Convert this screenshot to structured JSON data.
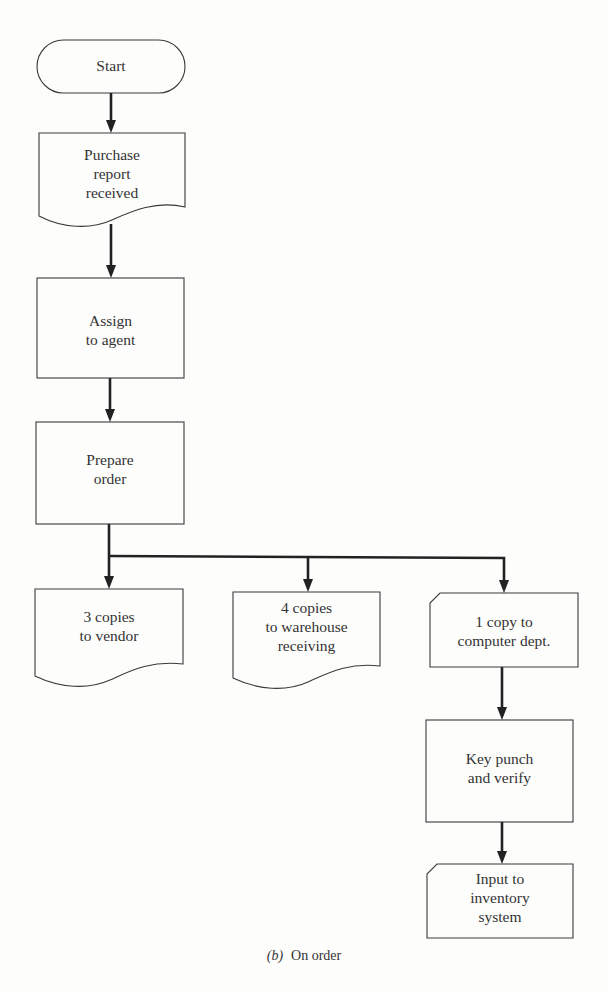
{
  "diagram": {
    "type": "flowchart",
    "caption": {
      "letter": "(b)",
      "text": "On order"
    },
    "colors": {
      "stroke": "#3a3a3a",
      "arrow": "#222222",
      "background": "#fdfdfc"
    },
    "nodes": [
      {
        "id": "start",
        "shape": "terminal",
        "lines": [
          "Start"
        ]
      },
      {
        "id": "purchase",
        "shape": "document",
        "lines": [
          "Purchase",
          "report",
          "received"
        ]
      },
      {
        "id": "assign",
        "shape": "process",
        "lines": [
          "Assign",
          "to agent"
        ]
      },
      {
        "id": "prepare",
        "shape": "process",
        "lines": [
          "Prepare",
          "order"
        ]
      },
      {
        "id": "vendor",
        "shape": "document",
        "lines": [
          "3 copies",
          "to vendor"
        ]
      },
      {
        "id": "warehouse",
        "shape": "document",
        "lines": [
          "4 copies",
          "to warehouse",
          "receiving"
        ]
      },
      {
        "id": "computer",
        "shape": "card",
        "lines": [
          "1 copy to",
          "computer dept."
        ]
      },
      {
        "id": "keypunch",
        "shape": "process",
        "lines": [
          "Key punch",
          "and verify"
        ]
      },
      {
        "id": "input",
        "shape": "card",
        "lines": [
          "Input to",
          "inventory",
          "system"
        ]
      }
    ],
    "edges": [
      {
        "from": "start",
        "to": "purchase"
      },
      {
        "from": "purchase",
        "to": "assign"
      },
      {
        "from": "assign",
        "to": "prepare"
      },
      {
        "from": "prepare",
        "to": "vendor"
      },
      {
        "from": "prepare",
        "to": "warehouse"
      },
      {
        "from": "prepare",
        "to": "computer"
      },
      {
        "from": "computer",
        "to": "keypunch"
      },
      {
        "from": "keypunch",
        "to": "input"
      }
    ]
  }
}
